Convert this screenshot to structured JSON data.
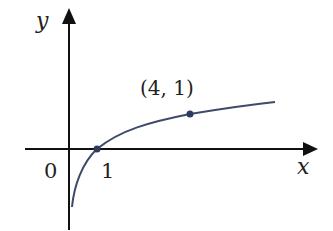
{
  "diagram": {
    "type": "function-graph",
    "function": "y = log_4(x)",
    "axes": {
      "x_label": "x",
      "y_label": "y",
      "origin_label": "0"
    },
    "points": [
      {
        "label": "1",
        "x": 1,
        "y": 0
      },
      {
        "label": "(4, 1)",
        "x": 4,
        "y": 1
      }
    ],
    "colors": {
      "axis": "#111111",
      "curve": "#3d4a6b",
      "point": "#2f3b5e"
    }
  }
}
